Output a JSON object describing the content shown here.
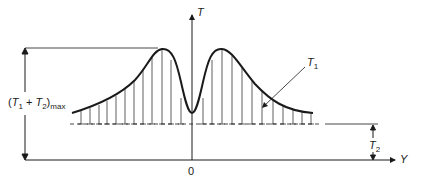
{
  "diagram": {
    "type": "distribution-curve",
    "axes": {
      "vertical": {
        "label": "T"
      },
      "horizontal": {
        "label": "Y",
        "origin_label": "0"
      }
    },
    "labels": {
      "max_dimension": {
        "open": "(",
        "t1": "T",
        "t1_sub": "1",
        "plus": " + ",
        "t2": "T",
        "t2_sub": "2",
        "close": ")",
        "suffix": "max"
      },
      "curve": {
        "t": "T",
        "sub": "1"
      },
      "offset": {
        "t": "T",
        "sub": "2"
      }
    },
    "colors": {
      "line": "#1a1a1a",
      "background": "#ffffff"
    }
  }
}
